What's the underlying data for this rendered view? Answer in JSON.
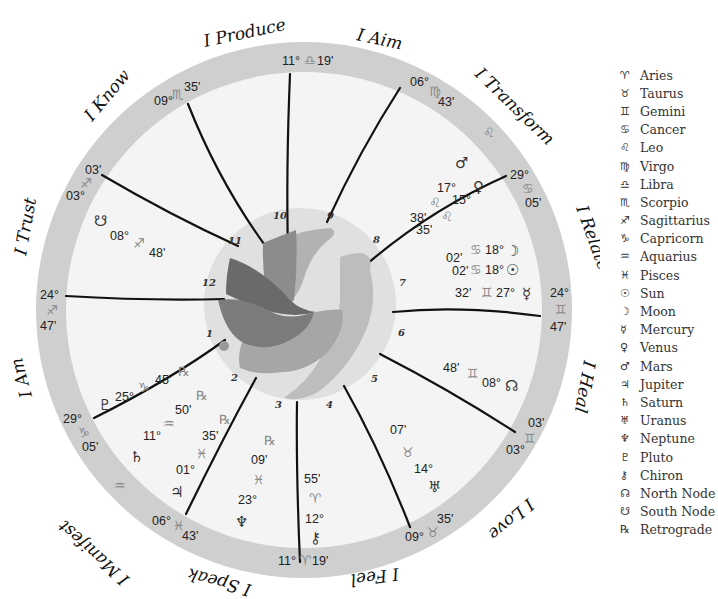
{
  "colors": {
    "outer_ring": "#cfcfcf",
    "inner_field": "#f4f4f4",
    "center_disk": "#e0e0e0",
    "cusp_line": "#111111",
    "dove_dark": "#6a6a6a",
    "dove_mid": "#8c8c8c",
    "dove_light": "#b2b2b2",
    "figure_light": "#bdbdbd"
  },
  "house_themes": [
    {
      "label": "I Produce"
    },
    {
      "label": "I Aim"
    },
    {
      "label": "I Transform"
    },
    {
      "label": "I Relate"
    },
    {
      "label": "I Heal"
    },
    {
      "label": "I Love"
    },
    {
      "label": "I Feel"
    },
    {
      "label": "I Speak"
    },
    {
      "label": "I Manifest"
    },
    {
      "label": "I Am"
    },
    {
      "label": "I Trust"
    },
    {
      "label": "I Know"
    }
  ],
  "house_numbers": [
    "1",
    "2",
    "3",
    "4",
    "5",
    "6",
    "7",
    "8",
    "9",
    "10",
    "11",
    "12"
  ],
  "cusps": [
    {
      "id": "mc",
      "deg": "11°",
      "sign": "♎",
      "min": "19'"
    },
    {
      "id": "c9",
      "deg": "06°",
      "sign": "♍",
      "min": "43'"
    },
    {
      "id": "c8",
      "deg": "29°",
      "sign": "♋",
      "min": "05'"
    },
    {
      "id": "dsc",
      "deg": "24°",
      "sign": "♊",
      "min": "47'"
    },
    {
      "id": "c6",
      "deg": "03°",
      "sign": "♊",
      "min": "03'"
    },
    {
      "id": "c5",
      "deg": "09°",
      "sign": "♉",
      "min": "35'"
    },
    {
      "id": "ic",
      "deg": "11°",
      "sign": "♈",
      "min": "19'"
    },
    {
      "id": "c3",
      "deg": "06°",
      "sign": "♓",
      "min": "43'"
    },
    {
      "id": "c2",
      "deg": "29°",
      "sign": "♑",
      "min": "05'"
    },
    {
      "id": "asc",
      "deg": "24°",
      "sign": "♐",
      "min": "47'"
    },
    {
      "id": "c12",
      "deg": "03°",
      "sign": "♐",
      "min": "03'"
    },
    {
      "id": "c11",
      "deg": "09°",
      "sign": "♏",
      "min": "35'"
    }
  ],
  "intercepted_signs": [
    {
      "sign": "♌"
    },
    {
      "sign": "♒"
    }
  ],
  "planets": [
    {
      "name": "Mars",
      "glyph": "♂",
      "deg": "17°",
      "sign": "♌",
      "min": "38'",
      "retro": ""
    },
    {
      "name": "Venus",
      "glyph": "♀",
      "deg": "15°",
      "sign": "♌",
      "min": "35'",
      "retro": ""
    },
    {
      "name": "Moon",
      "glyph": "☽",
      "deg": "18°",
      "sign": "♋",
      "min": "02'",
      "retro": ""
    },
    {
      "name": "Sun",
      "glyph": "☉",
      "deg": "18°",
      "sign": "♋",
      "min": "02'",
      "retro": ""
    },
    {
      "name": "Mercury",
      "glyph": "☿",
      "deg": "27°",
      "sign": "♊",
      "min": "32'",
      "retro": ""
    },
    {
      "name": "North Node",
      "glyph": "☊",
      "deg": "08°",
      "sign": "♊",
      "min": "48'",
      "retro": ""
    },
    {
      "name": "Uranus",
      "glyph": "♅",
      "deg": "14°",
      "sign": "♉",
      "min": "07'",
      "retro": ""
    },
    {
      "name": "Chiron",
      "glyph": "⚷",
      "deg": "12°",
      "sign": "♈",
      "min": "55'",
      "retro": ""
    },
    {
      "name": "Neptune",
      "glyph": "♆",
      "deg": "23°",
      "sign": "♓",
      "min": "09'",
      "retro": "℞"
    },
    {
      "name": "Jupiter",
      "glyph": "♃",
      "deg": "01°",
      "sign": "♓",
      "min": "35'",
      "retro": "℞"
    },
    {
      "name": "Saturn",
      "glyph": "♄",
      "deg": "11°",
      "sign": "♒",
      "min": "50'",
      "retro": "℞"
    },
    {
      "name": "Pluto",
      "glyph": "♇",
      "deg": "25°",
      "sign": "♑",
      "min": "45'",
      "retro": "℞"
    },
    {
      "name": "South Node",
      "glyph": "☋",
      "deg": "08°",
      "sign": "♐",
      "min": "48'",
      "retro": ""
    }
  ],
  "legend": [
    {
      "glyph": "♈",
      "label": "Aries"
    },
    {
      "glyph": "♉",
      "label": "Taurus"
    },
    {
      "glyph": "♊",
      "label": "Gemini"
    },
    {
      "glyph": "♋",
      "label": "Cancer"
    },
    {
      "glyph": "♌",
      "label": "Leo"
    },
    {
      "glyph": "♍",
      "label": "Virgo"
    },
    {
      "glyph": "♎",
      "label": "Libra"
    },
    {
      "glyph": "♏",
      "label": "Scorpio"
    },
    {
      "glyph": "♐",
      "label": "Sagittarius"
    },
    {
      "glyph": "♑",
      "label": "Capricorn"
    },
    {
      "glyph": "♒",
      "label": "Aquarius"
    },
    {
      "glyph": "♓",
      "label": "Pisces"
    },
    {
      "glyph": "☉",
      "label": "Sun"
    },
    {
      "glyph": "☽",
      "label": "Moon"
    },
    {
      "glyph": "☿",
      "label": "Mercury"
    },
    {
      "glyph": "♀",
      "label": "Venus"
    },
    {
      "glyph": "♂",
      "label": "Mars"
    },
    {
      "glyph": "♃",
      "label": "Jupiter"
    },
    {
      "glyph": "♄",
      "label": "Saturn"
    },
    {
      "glyph": "♅",
      "label": "Uranus"
    },
    {
      "glyph": "♆",
      "label": "Neptune"
    },
    {
      "glyph": "♇",
      "label": "Pluto"
    },
    {
      "glyph": "⚷",
      "label": "Chiron"
    },
    {
      "glyph": "☊",
      "label": "North Node"
    },
    {
      "glyph": "☋",
      "label": "South Node"
    },
    {
      "glyph": "℞",
      "label": "Retrograde"
    }
  ]
}
